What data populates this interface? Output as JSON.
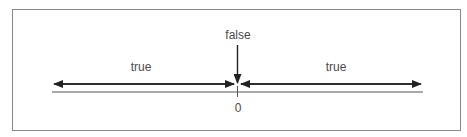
{
  "diagram": {
    "top_label": "false",
    "left_label": "true",
    "right_label": "true",
    "origin_label": "0",
    "colors": {
      "line": "#222222",
      "axis": "#555555",
      "text": "#4a4a4a",
      "frame": "#8a8a8a"
    }
  }
}
